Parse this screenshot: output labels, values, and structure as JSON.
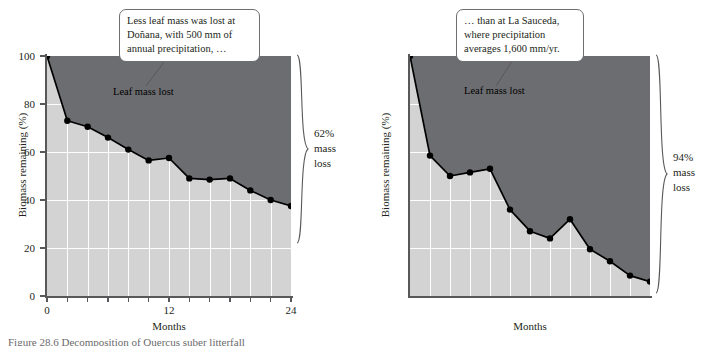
{
  "figure": {
    "caption": "Figure 28.6  Decomposition of Quercus suber litterfall"
  },
  "panels": [
    {
      "id": "donana",
      "callout_lines": [
        "Less leaf mass was lost at",
        "Doñana, with 500 mm of",
        "annual precipitation, …"
      ],
      "inline_label": "Leaf mass lost",
      "loss_lines": [
        "62%",
        "mass",
        "loss"
      ],
      "chart_data": {
        "type": "area",
        "title": "",
        "xlabel": "Months",
        "ylabel": "Biomass remaining (%)",
        "xlim": [
          0,
          24
        ],
        "ylim": [
          0,
          100
        ],
        "xticks": [
          0,
          2,
          4,
          6,
          8,
          10,
          12,
          14,
          16,
          18,
          20,
          22,
          24
        ],
        "xtick_labels": [
          "0",
          "",
          "",
          "",
          "",
          "",
          "12",
          "",
          "",
          "",
          "",
          "",
          "24"
        ],
        "yticks": [
          0,
          20,
          40,
          60,
          80,
          100
        ],
        "ytick_labels": [
          "0",
          "20",
          "40",
          "60",
          "80",
          "100"
        ],
        "grid": true,
        "legend": "none",
        "series": [
          {
            "name": "Biomass remaining",
            "x": [
              0,
              2,
              4,
              6,
              8,
              10,
              12,
              14,
              16,
              18,
              20,
              22,
              24
            ],
            "values": [
              100,
              73,
              70.5,
              66,
              61,
              56.5,
              57.5,
              49,
              48.5,
              49,
              44,
              40,
              37.5
            ]
          }
        ],
        "fill_above_label": "Leaf mass lost",
        "colors": {
          "area_lost": "#6c6d70",
          "area_remaining": "#d3d3d3",
          "line": "#000000",
          "grid": "#ffffff",
          "axis": "#58585b"
        }
      }
    },
    {
      "id": "la-sauceda",
      "callout_lines": [
        "… than at La Sauceda,",
        "where precipitation",
        "averages 1,600 mm/yr."
      ],
      "inline_label": "Leaf mass lost",
      "loss_lines": [
        "94%",
        "mass",
        "loss"
      ],
      "chart_data": {
        "type": "area",
        "title": "",
        "xlabel": "Months",
        "ylabel": "Biomass remaining (%)",
        "xlim": [
          0,
          24
        ],
        "ylim": [
          0,
          100
        ],
        "xticks": [
          0,
          2,
          4,
          6,
          8,
          10,
          12,
          14,
          16,
          18,
          20,
          22,
          24
        ],
        "xtick_labels": [
          "0",
          "",
          "",
          "",
          "",
          "",
          "12",
          "",
          "",
          "",
          "",
          "",
          "24"
        ],
        "yticks": [
          0,
          20,
          40,
          60,
          80,
          100
        ],
        "ytick_labels": [
          "0",
          "20",
          "40",
          "60",
          "80",
          "100"
        ],
        "grid": true,
        "legend": "none",
        "series": [
          {
            "name": "Biomass remaining",
            "x": [
              0,
              2,
              4,
              6,
              8,
              10,
              12,
              14,
              16,
              18,
              20,
              22,
              24
            ],
            "values": [
              100,
              58.5,
              50,
              51.5,
              53,
              36,
              27,
              24,
              32,
              19.5,
              14.5,
              8.5,
              6
            ]
          }
        ],
        "fill_above_label": "Leaf mass lost",
        "colors": {
          "area_lost": "#6c6d70",
          "area_remaining": "#d3d3d3",
          "line": "#000000",
          "grid": "#ffffff",
          "axis": "#58585b"
        }
      }
    }
  ]
}
